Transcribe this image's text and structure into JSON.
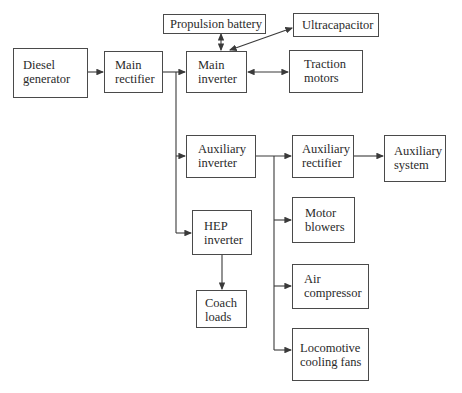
{
  "diagram": {
    "title": "",
    "nodes": [
      {
        "id": "diesel_generator",
        "label": "Diesel\ngenerator",
        "box": [
          13,
          48,
          75,
          50
        ],
        "text": [
          23,
          58
        ]
      },
      {
        "id": "main_rectifier",
        "label": "Main\nrectifier",
        "box": [
          104,
          51,
          59,
          42
        ],
        "text": [
          115,
          58
        ]
      },
      {
        "id": "propulsion_battery",
        "label": "Propulsion battery",
        "box": [
          163,
          14,
          103,
          19
        ],
        "text": [
          170,
          16
        ]
      },
      {
        "id": "main_inverter",
        "label": "Main\ninverter",
        "box": [
          186,
          51,
          61,
          42
        ],
        "text": [
          198,
          58
        ]
      },
      {
        "id": "ultracapacitor",
        "label": "Ultracapacitor",
        "box": [
          293,
          13,
          86,
          24
        ],
        "text": [
          302,
          17
        ]
      },
      {
        "id": "traction_motors",
        "label": "Traction\nmotors",
        "box": [
          289,
          50,
          74,
          43
        ],
        "text": [
          304,
          57
        ]
      },
      {
        "id": "auxiliary_inverter",
        "label": "Auxiliary\ninverter",
        "box": [
          186,
          135,
          70,
          43
        ],
        "text": [
          198,
          142
        ]
      },
      {
        "id": "auxiliary_rectifier",
        "label": "Auxiliary\nrectifier",
        "box": [
          292,
          135,
          62,
          43
        ],
        "text": [
          302,
          142
        ]
      },
      {
        "id": "auxiliary_system",
        "label": "Auxiliary\nsystem",
        "box": [
          384,
          135,
          62,
          47
        ],
        "text": [
          394,
          144
        ]
      },
      {
        "id": "hep_inverter",
        "label": "HEP\ninverter",
        "box": [
          192,
          210,
          60,
          45
        ],
        "text": [
          204,
          219
        ]
      },
      {
        "id": "coach_loads",
        "label": "Coach\nloads",
        "box": [
          196,
          290,
          51,
          38
        ],
        "text": [
          205,
          296
        ]
      },
      {
        "id": "motor_blowers",
        "label": "Motor\nblowers",
        "box": [
          292,
          197,
          63,
          46
        ],
        "text": [
          305,
          206
        ]
      },
      {
        "id": "air_compressor",
        "label": "Air\ncompressor",
        "box": [
          292,
          264,
          77,
          45
        ],
        "text": [
          304,
          272
        ]
      },
      {
        "id": "locomotive_cooling_fans",
        "label": "Locomotive\ncooling fans",
        "box": [
          292,
          328,
          77,
          53
        ],
        "text": [
          300,
          341
        ]
      }
    ],
    "edges": [
      {
        "from": "diesel_generator",
        "to": "main_rectifier",
        "type": "arrow"
      },
      {
        "from": "main_rectifier",
        "to": "main_inverter",
        "type": "arrow"
      },
      {
        "from": "main_rectifier",
        "to": "auxiliary_inverter",
        "type": "arrow"
      },
      {
        "from": "main_rectifier",
        "to": "hep_inverter",
        "type": "arrow"
      },
      {
        "from": "propulsion_battery",
        "to": "main_inverter",
        "type": "bidirectional"
      },
      {
        "from": "main_inverter",
        "to": "ultracapacitor",
        "type": "bidirectional"
      },
      {
        "from": "main_inverter",
        "to": "traction_motors",
        "type": "bidirectional"
      },
      {
        "from": "auxiliary_inverter",
        "to": "auxiliary_rectifier",
        "type": "arrow"
      },
      {
        "from": "auxiliary_inverter",
        "to": "motor_blowers",
        "type": "arrow"
      },
      {
        "from": "auxiliary_inverter",
        "to": "air_compressor",
        "type": "arrow"
      },
      {
        "from": "auxiliary_inverter",
        "to": "locomotive_cooling_fans",
        "type": "arrow"
      },
      {
        "from": "auxiliary_rectifier",
        "to": "auxiliary_system",
        "type": "arrow"
      },
      {
        "from": "hep_inverter",
        "to": "coach_loads",
        "type": "arrow"
      }
    ]
  },
  "labels": {
    "diesel_generator": "Diesel\ngenerator",
    "main_rectifier": "Main\nrectifier",
    "propulsion_battery": "Propulsion battery",
    "main_inverter": "Main\ninverter",
    "ultracapacitor": "Ultracapacitor",
    "traction_motors": "Traction\nmotors",
    "auxiliary_inverter": "Auxiliary\ninverter",
    "auxiliary_rectifier": "Auxiliary\nrectifier",
    "auxiliary_system": "Auxiliary\nsystem",
    "hep_inverter": "HEP\ninverter",
    "coach_loads": "Coach\nloads",
    "motor_blowers": "Motor\nblowers",
    "air_compressor": "Air\ncompressor",
    "locomotive_cooling_fans": "Locomotive\ncooling fans"
  },
  "colors": {
    "line": "#3a3a3a",
    "border": "#4a4a4a",
    "text": "#2a2a2a",
    "background": "#ffffff"
  }
}
